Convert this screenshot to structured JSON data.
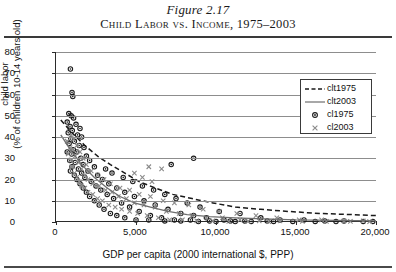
{
  "figure": {
    "number": "Figure 2.17",
    "title": "Child Labor vs. Income, 1975–2003"
  },
  "chart_data": {
    "type": "scatter",
    "title": "Child Labor vs. Income, 1975–2003",
    "xlabel": "GDP per capita (2000 international $, PPP)",
    "ylabel": "child labor (% of children 10-14 years old)",
    "ylabel_line1": "child labor",
    "ylabel_line2": "(% of children 10-14 years old)",
    "xlim": [
      0,
      20000
    ],
    "ylim": [
      0,
      80
    ],
    "xticks": [
      0,
      5000,
      10000,
      15000,
      20000
    ],
    "xtick_labels": [
      "0",
      "5,000",
      "10,000",
      "15,000",
      "20,000"
    ],
    "yticks": [
      0,
      10,
      20,
      30,
      40,
      50,
      60,
      70,
      80
    ],
    "ytick_labels": [
      "0",
      "10",
      "20",
      "30",
      "40",
      "50",
      "60",
      "70",
      "80"
    ],
    "grid": "horizontal",
    "legend_position": "top-right",
    "legend": [
      {
        "key": "clt1975",
        "label": "clt1975",
        "style": "dashed-line",
        "color": "#1a1a1a"
      },
      {
        "key": "clt2003",
        "label": "clt2003",
        "style": "solid-line",
        "color": "#6e6e6e"
      },
      {
        "key": "cl1975",
        "label": "cl1975",
        "style": "circle-marker",
        "color": "#1a1a1a"
      },
      {
        "key": "cl2003",
        "label": "cl2003",
        "style": "x-marker",
        "color": "#8a8a8a"
      }
    ],
    "series": [
      {
        "name": "cl1975",
        "label": "cl1975",
        "type": "scatter",
        "marker": "circle",
        "color": "#1a1a1a",
        "points": [
          [
            900,
            72
          ],
          [
            1000,
            61
          ],
          [
            1050,
            59
          ],
          [
            800,
            51
          ],
          [
            950,
            50
          ],
          [
            1100,
            49
          ],
          [
            700,
            47
          ],
          [
            1250,
            46
          ],
          [
            880,
            45
          ],
          [
            1500,
            44
          ],
          [
            1020,
            43
          ],
          [
            760,
            42
          ],
          [
            1350,
            41
          ],
          [
            1600,
            40
          ],
          [
            920,
            39
          ],
          [
            1150,
            38
          ],
          [
            820,
            37
          ],
          [
            1450,
            36
          ],
          [
            1750,
            35
          ],
          [
            1080,
            34
          ],
          [
            700,
            33
          ],
          [
            1300,
            33
          ],
          [
            980,
            32
          ],
          [
            1900,
            31
          ],
          [
            8600,
            30
          ],
          [
            1550,
            30
          ],
          [
            860,
            29
          ],
          [
            2100,
            29
          ],
          [
            1200,
            28
          ],
          [
            7200,
            27
          ],
          [
            1700,
            27
          ],
          [
            1000,
            26
          ],
          [
            2400,
            26
          ],
          [
            1400,
            25
          ],
          [
            3100,
            25
          ],
          [
            900,
            24
          ],
          [
            2000,
            24
          ],
          [
            1600,
            23
          ],
          [
            3500,
            23
          ],
          [
            1150,
            22
          ],
          [
            2600,
            22
          ],
          [
            4200,
            21
          ],
          [
            1800,
            21
          ],
          [
            1300,
            20
          ],
          [
            2900,
            20
          ],
          [
            4800,
            19
          ],
          [
            2200,
            19
          ],
          [
            1500,
            18
          ],
          [
            3300,
            18
          ],
          [
            5400,
            17
          ],
          [
            2500,
            17
          ],
          [
            1700,
            16
          ],
          [
            3800,
            16
          ],
          [
            6100,
            15
          ],
          [
            2800,
            15
          ],
          [
            1900,
            14
          ],
          [
            4300,
            14
          ],
          [
            6800,
            13
          ],
          [
            3200,
            13
          ],
          [
            2100,
            12
          ],
          [
            4900,
            12
          ],
          [
            7500,
            11
          ],
          [
            3600,
            11
          ],
          [
            2400,
            10
          ],
          [
            5500,
            10
          ],
          [
            8200,
            9
          ],
          [
            4100,
            9
          ],
          [
            2700,
            8
          ],
          [
            6200,
            8
          ],
          [
            9000,
            7
          ],
          [
            4600,
            7
          ],
          [
            3000,
            6
          ],
          [
            7000,
            6
          ],
          [
            10200,
            5
          ],
          [
            5200,
            5
          ],
          [
            3400,
            4
          ],
          [
            7800,
            4
          ],
          [
            11500,
            4
          ],
          [
            5900,
            3
          ],
          [
            3800,
            3
          ],
          [
            8600,
            3
          ],
          [
            12800,
            2
          ],
          [
            6600,
            2
          ],
          [
            4300,
            2
          ],
          [
            9400,
            2
          ],
          [
            14000,
            1
          ],
          [
            7400,
            1
          ],
          [
            5000,
            1
          ],
          [
            10500,
            1
          ],
          [
            15500,
            1
          ],
          [
            8400,
            1
          ],
          [
            5800,
            1
          ],
          [
            11800,
            0.5
          ],
          [
            16800,
            0.5
          ],
          [
            9600,
            0.5
          ],
          [
            6800,
            0.5
          ],
          [
            13200,
            0.5
          ],
          [
            18000,
            0.5
          ],
          [
            10900,
            0.5
          ],
          [
            7800,
            0.5
          ],
          [
            14800,
            0.3
          ],
          [
            19200,
            0.3
          ],
          [
            12200,
            0.3
          ],
          [
            8900,
            0.3
          ],
          [
            16200,
            0.3
          ],
          [
            19800,
            0.3
          ],
          [
            13600,
            0.3
          ],
          [
            10000,
            0.3
          ],
          [
            17500,
            0.2
          ],
          [
            11200,
            0.2
          ]
        ]
      },
      {
        "name": "cl2003",
        "label": "cl2003",
        "type": "scatter",
        "marker": "x",
        "color": "#8a8a8a",
        "points": [
          [
            800,
            44
          ],
          [
            950,
            41
          ],
          [
            1100,
            39
          ],
          [
            700,
            38
          ],
          [
            1300,
            36
          ],
          [
            880,
            35
          ],
          [
            1050,
            34
          ],
          [
            1500,
            33
          ],
          [
            760,
            32
          ],
          [
            1200,
            31
          ],
          [
            1700,
            30
          ],
          [
            920,
            29
          ],
          [
            1400,
            28
          ],
          [
            1900,
            27
          ],
          [
            1000,
            26
          ],
          [
            5800,
            26
          ],
          [
            1600,
            25
          ],
          [
            6600,
            25
          ],
          [
            2200,
            24
          ],
          [
            1150,
            23
          ],
          [
            4900,
            23
          ],
          [
            1800,
            22
          ],
          [
            2600,
            22
          ],
          [
            1300,
            21
          ],
          [
            5400,
            21
          ],
          [
            2000,
            20
          ],
          [
            3000,
            20
          ],
          [
            1450,
            19
          ],
          [
            6000,
            19
          ],
          [
            2300,
            18
          ],
          [
            3400,
            18
          ],
          [
            1600,
            17
          ],
          [
            2700,
            17
          ],
          [
            4000,
            16
          ],
          [
            1800,
            16
          ],
          [
            3100,
            15
          ],
          [
            4600,
            15
          ],
          [
            2000,
            14
          ],
          [
            3500,
            14
          ],
          [
            5200,
            13
          ],
          [
            2300,
            13
          ],
          [
            3900,
            12
          ],
          [
            5900,
            12
          ],
          [
            2600,
            11
          ],
          [
            4400,
            11
          ],
          [
            6700,
            10
          ],
          [
            2900,
            10
          ],
          [
            4900,
            9
          ],
          [
            7400,
            9
          ],
          [
            3300,
            8
          ],
          [
            5500,
            8
          ],
          [
            8300,
            8
          ],
          [
            3700,
            7
          ],
          [
            6200,
            7
          ],
          [
            9200,
            6
          ],
          [
            4100,
            6
          ],
          [
            6900,
            5
          ],
          [
            10200,
            5
          ],
          [
            4600,
            5
          ],
          [
            7700,
            4
          ],
          [
            11300,
            4
          ],
          [
            5100,
            4
          ],
          [
            8500,
            3
          ],
          [
            12500,
            3
          ],
          [
            5700,
            3
          ],
          [
            9400,
            2
          ],
          [
            13800,
            2
          ],
          [
            6400,
            2
          ],
          [
            10400,
            2
          ],
          [
            15200,
            1
          ],
          [
            7100,
            1
          ],
          [
            11500,
            1
          ],
          [
            16600,
            1
          ],
          [
            7900,
            1
          ],
          [
            12700,
            0.5
          ],
          [
            18000,
            0.5
          ],
          [
            8800,
            0.5
          ],
          [
            14000,
            0.5
          ],
          [
            19200,
            0.5
          ],
          [
            9800,
            0.5
          ],
          [
            15400,
            0.3
          ],
          [
            10800,
            0.3
          ],
          [
            16900,
            0.3
          ],
          [
            12000,
            0.3
          ],
          [
            18400,
            0.3
          ],
          [
            13300,
            0.2
          ],
          [
            19600,
            0.2
          ]
        ]
      },
      {
        "name": "clt1975",
        "label": "clt1975",
        "type": "trendline",
        "style": "dashed",
        "color": "#1a1a1a",
        "points": [
          [
            300,
            48
          ],
          [
            1000,
            42
          ],
          [
            1800,
            36
          ],
          [
            2600,
            31
          ],
          [
            3400,
            27
          ],
          [
            4300,
            23
          ],
          [
            5200,
            19
          ],
          [
            6200,
            16
          ],
          [
            7300,
            13
          ],
          [
            8500,
            11
          ],
          [
            9800,
            9
          ],
          [
            11200,
            7
          ],
          [
            12800,
            6
          ],
          [
            14500,
            5
          ],
          [
            16500,
            4
          ],
          [
            18500,
            3.5
          ],
          [
            20000,
            3
          ]
        ]
      },
      {
        "name": "clt2003",
        "label": "clt2003",
        "type": "trendline",
        "style": "solid",
        "color": "#6e6e6e",
        "points": [
          [
            300,
            41
          ],
          [
            900,
            34
          ],
          [
            1600,
            27
          ],
          [
            2400,
            21
          ],
          [
            3200,
            16
          ],
          [
            4000,
            12
          ],
          [
            4900,
            9
          ],
          [
            5900,
            7
          ],
          [
            7000,
            5
          ],
          [
            8200,
            3.5
          ],
          [
            9600,
            2.5
          ],
          [
            11200,
            2
          ],
          [
            13000,
            1.5
          ],
          [
            15000,
            1
          ],
          [
            17500,
            0.8
          ],
          [
            20000,
            0.5
          ]
        ]
      }
    ]
  }
}
